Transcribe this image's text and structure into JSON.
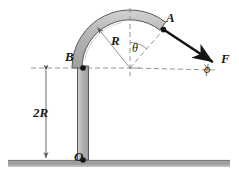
{
  "figure": {
    "labels": {
      "point_o": "O",
      "point_b": "B",
      "point_a": "A",
      "dimension_2r": "2R",
      "radius_r": "R",
      "angle_theta": "θ",
      "angle_phi": "ϕ",
      "force_f": "F"
    },
    "colors": {
      "tube_fill": "#b9b9b9",
      "tube_outline": "#4d4d4d",
      "ground_fill": "#9a9a9a",
      "ground_shadow": "#bdbdbd",
      "line": "#1a1a1a",
      "dashed": "#8a8a8a",
      "background": "#ffffff"
    },
    "geometry": {
      "arc_center": [
        130,
        68
      ],
      "arc_outer_radius": 58,
      "arc_inner_radius": 48,
      "point_o": [
        83,
        160
      ],
      "point_b": [
        83,
        68
      ],
      "point_a": [
        163,
        29
      ],
      "force_tip": [
        213,
        62
      ],
      "ground_y": 160,
      "dimension_x": 46
    }
  }
}
